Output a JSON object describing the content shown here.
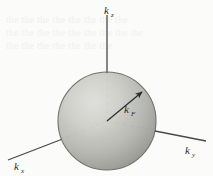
{
  "figure": {
    "caption_absent": true,
    "background_color": "#fbfbfa",
    "ink_color": "#2b2b2b",
    "sphere": {
      "name": "fermi-sphere",
      "center_x": 107,
      "center_y": 121,
      "radius": 49,
      "fill_light": "#d6d6d2",
      "fill_mid": "#b8b8b3",
      "fill_dark": "#8f8f8a",
      "outline_color": "#6e6e69"
    },
    "axes": [
      {
        "id": "kz",
        "label_main": "k",
        "label_sub": "z",
        "label_x": 108,
        "label_y": 12,
        "style": "solid",
        "from_x": 107,
        "from_y": 121,
        "to_x": 107,
        "to_y": 15
      },
      {
        "id": "ky",
        "label_main": "k",
        "label_sub": "y",
        "label_x": 188,
        "label_y": 152,
        "style": "solid",
        "from_x": 107,
        "from_y": 121,
        "to_x": 206,
        "to_y": 141
      },
      {
        "id": "kx",
        "label_main": "k",
        "label_sub": "x",
        "label_x": 17,
        "label_y": 168,
        "style": "solid",
        "from_x": 107,
        "from_y": 121,
        "to_x": 8,
        "to_y": 160
      }
    ],
    "radius_vector": {
      "id": "kF",
      "label_main": "k",
      "label_sub": "F",
      "label_x": 128,
      "label_y": 112,
      "from_x": 107,
      "from_y": 121,
      "to_x": 143,
      "to_y": 91,
      "arrowhead": true
    },
    "ghost_text": "the the the the the the the the\nthe the the the the the the the the\nthe the the the the the the"
  }
}
